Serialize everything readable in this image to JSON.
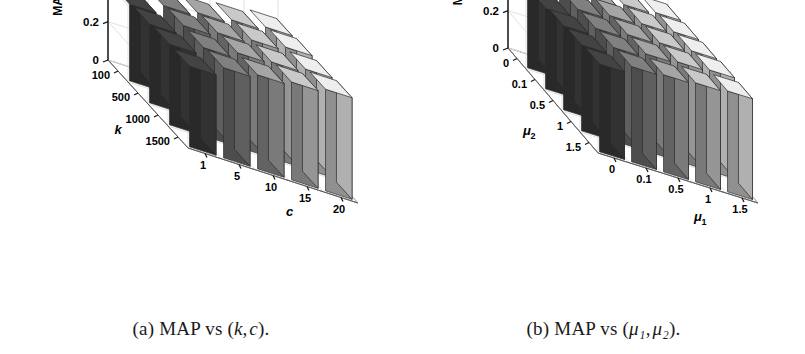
{
  "figure": {
    "panels": [
      {
        "id": "panel-a",
        "caption_prefix": "(a)",
        "caption_text": "MAP vs",
        "caption_vars": [
          "k",
          "c"
        ],
        "zlabel": "MAP",
        "xlabel": "c",
        "ylabel": "k",
        "zticks": [
          "0",
          "0.2",
          "0.4",
          "0.6"
        ]
      },
      {
        "id": "panel-b",
        "caption_prefix": "(b)",
        "caption_text": "MAP vs",
        "caption_vars": [
          "μ₁",
          "μ₂"
        ],
        "zlabel": "MAP",
        "xlabel": "μ",
        "xlabel_sub": "1",
        "ylabel": "μ",
        "ylabel_sub": "2",
        "zticks": [
          "0",
          "0.2",
          "0.4",
          "0.6"
        ]
      }
    ]
  },
  "colors": {
    "background": "#ffffff",
    "text": "#000000",
    "axis": "#1a1a1a",
    "grid": "#d9d9d9",
    "bar_edge": "#2b2b2b",
    "bar_ramp": [
      "#3a3a3a",
      "#6e6e6e",
      "#8e8e8e",
      "#adadad",
      "#cdcdcd"
    ]
  },
  "chart_data": [
    {
      "type": "bar",
      "subtype": "bar3",
      "title": "(a) MAP vs (k, c)",
      "xlabel": "c",
      "ylabel": "k",
      "zlabel": "MAP",
      "xticklabels": [
        "1",
        "5",
        "10",
        "15",
        "20"
      ],
      "yticklabels": [
        "100",
        "500",
        "1000",
        "1500"
      ],
      "zticklabels": [
        "0",
        "0.2",
        "0.4",
        "0.6"
      ],
      "zlim": [
        0,
        0.6
      ],
      "grid": true,
      "legend": "none",
      "x": [
        1,
        5,
        10,
        15,
        20
      ],
      "y": [
        100,
        500,
        1000,
        1500
      ],
      "z_matrix_note": "rows = k (100,500,1000,1500), cols = c (1,5,10,15,20)",
      "series": [
        {
          "name": "k=100",
          "values": [
            0.4,
            0.45,
            0.47,
            0.49,
            0.51
          ]
        },
        {
          "name": "k=500",
          "values": [
            0.41,
            0.46,
            0.48,
            0.5,
            0.52
          ]
        },
        {
          "name": "k=1000",
          "values": [
            0.42,
            0.46,
            0.49,
            0.5,
            0.52
          ]
        },
        {
          "name": "k=1500",
          "values": [
            0.42,
            0.47,
            0.49,
            0.51,
            0.53
          ]
        }
      ]
    },
    {
      "type": "bar",
      "subtype": "bar3",
      "title": "(b) MAP vs (μ₁, μ₂)",
      "xlabel": "μ₁",
      "ylabel": "μ₂",
      "zlabel": "MAP",
      "xticklabels": [
        "0",
        "0.1",
        "0.5",
        "1",
        "1.5"
      ],
      "yticklabels": [
        "0",
        "0.1",
        "0.5",
        "1",
        "1.5"
      ],
      "zticklabels": [
        "0",
        "0.2",
        "0.4",
        "0.6"
      ],
      "zlim": [
        0,
        0.6
      ],
      "grid": true,
      "legend": "none",
      "x": [
        0,
        0.1,
        0.5,
        1,
        1.5
      ],
      "y": [
        0,
        0.1,
        0.5,
        1,
        1.5
      ],
      "z_matrix_note": "rows = mu2 (0,0.1,0.5,1,1.5), cols = mu1 (0,0.1,0.5,1,1.5)",
      "series": [
        {
          "name": "mu2=0",
          "values": [
            0.4,
            0.46,
            0.48,
            0.5,
            0.51
          ]
        },
        {
          "name": "mu2=0.1",
          "values": [
            0.43,
            0.48,
            0.5,
            0.51,
            0.52
          ]
        },
        {
          "name": "mu2=0.5",
          "values": [
            0.45,
            0.49,
            0.51,
            0.52,
            0.53
          ]
        },
        {
          "name": "mu2=1",
          "values": [
            0.46,
            0.5,
            0.52,
            0.53,
            0.54
          ]
        },
        {
          "name": "mu2=1.5",
          "values": [
            0.47,
            0.51,
            0.52,
            0.53,
            0.54
          ]
        }
      ]
    }
  ]
}
